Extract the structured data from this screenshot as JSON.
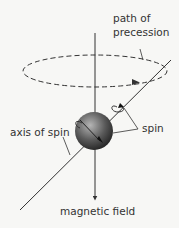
{
  "labels": {
    "path_line1": "path of",
    "path_line2": "precession",
    "axis_of_spin": "axis of spin",
    "spin": "spin",
    "magnetic_field": "magnetic field"
  },
  "colors": {
    "line": "#333333",
    "background": "#f7f7f5",
    "sphere_light": "#9a9a9a",
    "sphere_dark": "#2e2e2e"
  }
}
